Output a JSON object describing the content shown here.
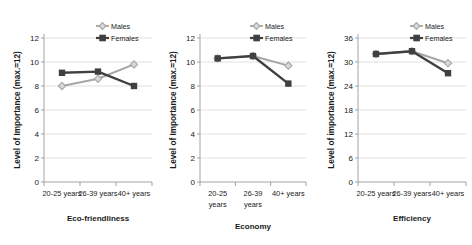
{
  "figure": {
    "series_colors": {
      "males": "#a6a6a6",
      "females": "#404040"
    },
    "grid_color": "#d9d9d9",
    "axis_color": "#9a9a9a",
    "legend_labels": {
      "males": "Males",
      "females": "Females"
    },
    "legend_position": "top-right",
    "marker_males": "diamond",
    "marker_females": "square"
  },
  "chart_data": [
    {
      "type": "line",
      "title": "Eco-friendliness",
      "xlabel": "Eco-friendliness",
      "ylabel": "Level of Importance (max.=12)",
      "categories": [
        "20-25 years",
        "26-39 years",
        "40+ years"
      ],
      "category_lines": [
        [
          "20-25 years"
        ],
        [
          "26-39 years"
        ],
        [
          "40+ years"
        ]
      ],
      "series": [
        {
          "name": "Males",
          "values": [
            8.0,
            8.6,
            9.8
          ]
        },
        {
          "name": "Females",
          "values": [
            9.1,
            9.2,
            8.0
          ]
        }
      ],
      "ylim": [
        0,
        12
      ],
      "yticks": [
        0,
        2,
        4,
        6,
        8,
        10,
        12
      ],
      "grid": true,
      "legend": [
        "Males",
        "Females"
      ]
    },
    {
      "type": "line",
      "title": "Economy",
      "xlabel": "Economy",
      "ylabel": "Level of Importance (max.=12)",
      "categories": [
        "20-25 years",
        "26-39 years",
        "40+ years"
      ],
      "category_lines": [
        [
          "20-25",
          "years"
        ],
        [
          "26-39",
          "years"
        ],
        [
          "40+ years"
        ]
      ],
      "series": [
        {
          "name": "Males",
          "values": [
            10.3,
            10.5,
            9.7
          ]
        },
        {
          "name": "Females",
          "values": [
            10.3,
            10.5,
            8.2
          ]
        }
      ],
      "ylim": [
        0,
        12
      ],
      "yticks": [
        0,
        2,
        4,
        6,
        8,
        10,
        12
      ],
      "grid": true,
      "legend": [
        "Males",
        "Females"
      ]
    },
    {
      "type": "line",
      "title": "Efficiency",
      "xlabel": "Efficiency",
      "ylabel": "Level of importance (max.=12)",
      "categories": [
        "20-25 years",
        "26-39 years",
        "40+ years"
      ],
      "category_lines": [
        [
          "20-25 years"
        ],
        [
          "26-39 years"
        ],
        [
          "40+ years"
        ]
      ],
      "series": [
        {
          "name": "Males",
          "values": [
            32.0,
            32.7,
            29.7
          ]
        },
        {
          "name": "Females",
          "values": [
            32.0,
            32.7,
            27.2
          ]
        }
      ],
      "ylim": [
        0,
        36
      ],
      "yticks": [
        0,
        6,
        12,
        18,
        24,
        30,
        36
      ],
      "grid": true,
      "legend": [
        "Males",
        "Females"
      ]
    }
  ]
}
